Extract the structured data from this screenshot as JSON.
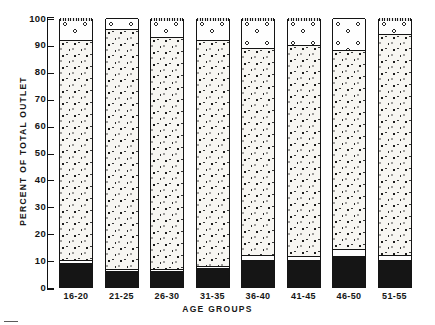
{
  "chart_data": {
    "type": "bar",
    "subtype": "stacked-percentage-column",
    "title": "",
    "xlabel": "AGE GROUPS",
    "ylabel": "PERCENT OF TOTAL OUTLET",
    "ylim": [
      0,
      100
    ],
    "yticks": [
      0,
      10,
      20,
      30,
      40,
      50,
      60,
      70,
      80,
      90,
      100
    ],
    "ytick_labels": [
      "0",
      "10",
      "20",
      "30",
      "40",
      "50",
      "60",
      "70",
      "80",
      "90",
      "100"
    ],
    "grid": false,
    "legend": "none",
    "categories": [
      "16-20",
      "21-25",
      "26-30",
      "31-35",
      "36-40",
      "41-45",
      "46-50",
      "51-55"
    ],
    "series": [
      {
        "name": "solid-black-segment",
        "fill": "solid",
        "values": [
          9.0,
          6.0,
          6.0,
          7.0,
          10.0,
          10.0,
          11.5,
          10.0
        ]
      },
      {
        "name": "blank-white-segment",
        "fill": "blank",
        "values": [
          1.0,
          0.8,
          0.8,
          0.8,
          2.0,
          1.5,
          2.5,
          2.0
        ]
      },
      {
        "name": "fine-stipple-segment",
        "fill": "stipple",
        "values": [
          82.0,
          89.2,
          86.2,
          84.2,
          77.0,
          78.5,
          74.0,
          82.0
        ]
      },
      {
        "name": "open-circle-segment",
        "fill": "circles",
        "values": [
          8.0,
          4.0,
          7.0,
          8.0,
          11.0,
          10.0,
          12.0,
          6.0
        ]
      }
    ],
    "segment_boundaries": [
      {
        "category": "16-20",
        "solid_top": 9.0,
        "blank_top": 10.0,
        "stipple_top": 92.0,
        "circles_top": 100
      },
      {
        "category": "21-25",
        "solid_top": 6.0,
        "blank_top": 6.8,
        "stipple_top": 96.0,
        "circles_top": 100
      },
      {
        "category": "26-30",
        "solid_top": 6.0,
        "blank_top": 6.8,
        "stipple_top": 93.0,
        "circles_top": 100
      },
      {
        "category": "31-35",
        "solid_top": 7.0,
        "blank_top": 7.8,
        "stipple_top": 92.0,
        "circles_top": 100
      },
      {
        "category": "36-40",
        "solid_top": 10.0,
        "blank_top": 12.0,
        "stipple_top": 89.0,
        "circles_top": 100
      },
      {
        "category": "41-45",
        "solid_top": 10.0,
        "blank_top": 11.5,
        "stipple_top": 90.0,
        "circles_top": 100
      },
      {
        "category": "46-50",
        "solid_top": 11.5,
        "blank_top": 14.0,
        "stipple_top": 88.0,
        "circles_top": 100
      },
      {
        "category": "51-55",
        "solid_top": 10.0,
        "blank_top": 12.0,
        "stipple_top": 94.0,
        "circles_top": 100
      }
    ],
    "bars_with_top_cap": [
      "16-20",
      "26-30",
      "31-35",
      "36-40",
      "41-45",
      "51-55"
    ]
  },
  "axis": {
    "y_title": "PERCENT OF TOTAL OUTLET",
    "x_title": "AGE GROUPS"
  },
  "caption": {
    "text": ""
  },
  "colors": {
    "ink": "#151515",
    "paper": "#ffffff",
    "stipple_bg": "#f7f6f2"
  }
}
